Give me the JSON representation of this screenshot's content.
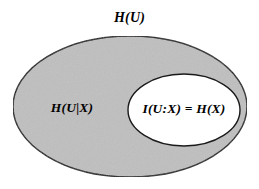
{
  "figure": {
    "title_label": "H(U)",
    "background_color": "#ffffff",
    "labels": {
      "total_entropy": "H(U)",
      "conditional_entropy": "H(U|X)",
      "mutual_information": "I(U:X) = H(X)"
    },
    "regions": [
      {
        "name": "outer-ellipse",
        "label": "H(U)",
        "fill_color": "#bfbfbf",
        "stroke_color": "#1a1a1a",
        "cx": 130,
        "cy": 106.5,
        "rx": 117,
        "ry": 70.5
      },
      {
        "name": "inner-ellipse",
        "label": "I(U:X) = H(X)",
        "fill_color": "#ffffff",
        "stroke_color": "#1a1a1a",
        "cx": 184,
        "cy": 110,
        "rx": 56,
        "ry": 36
      }
    ]
  }
}
